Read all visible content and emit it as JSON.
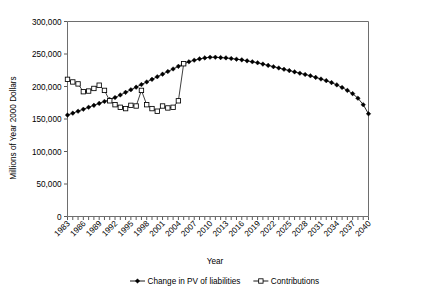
{
  "chart_data": {
    "type": "line",
    "title": "",
    "xlabel": "Year",
    "ylabel": "Millions of Year 2000 Dollars",
    "ylim": [
      0,
      300000
    ],
    "xlim": [
      1983,
      2040
    ],
    "grid": false,
    "legend_position": "bottom",
    "ytick_labels": [
      "300,000",
      "250,000",
      "200,000",
      "150,000",
      "100,000",
      "50,000",
      "0"
    ],
    "ytick_values": [
      300000,
      250000,
      200000,
      150000,
      100000,
      50000,
      0
    ],
    "xtick_labels": [
      "1983",
      "1986",
      "1989",
      "1992",
      "1995",
      "1998",
      "2001",
      "2004",
      "2007",
      "2010",
      "2013",
      "2016",
      "2019",
      "2022",
      "2025",
      "2028",
      "2031",
      "2034",
      "2037",
      "2040"
    ],
    "xtick_values": [
      1983,
      1986,
      1989,
      1992,
      1995,
      1998,
      2001,
      2004,
      2007,
      2010,
      2013,
      2016,
      2019,
      2022,
      2025,
      2028,
      2031,
      2034,
      2037,
      2040
    ],
    "series": [
      {
        "name": "Change in PV of liabilities",
        "marker": "filled-diamond",
        "x": [
          1983,
          1984,
          1985,
          1986,
          1987,
          1988,
          1989,
          1990,
          1991,
          1992,
          1993,
          1994,
          1995,
          1996,
          1997,
          1998,
          1999,
          2000,
          2001,
          2002,
          2003,
          2004,
          2005,
          2006,
          2007,
          2008,
          2009,
          2010,
          2011,
          2012,
          2013,
          2014,
          2015,
          2016,
          2017,
          2018,
          2019,
          2020,
          2021,
          2022,
          2023,
          2024,
          2025,
          2026,
          2027,
          2028,
          2029,
          2030,
          2031,
          2032,
          2033,
          2034,
          2035,
          2036,
          2037,
          2038,
          2039,
          2040
        ],
        "values": [
          156000,
          159000,
          162000,
          165000,
          168000,
          171000,
          174000,
          177000,
          180000,
          183000,
          187000,
          191000,
          195000,
          199000,
          203000,
          207000,
          211000,
          215000,
          219000,
          223000,
          227000,
          231000,
          235000,
          238000,
          240500,
          242500,
          244000,
          245000,
          245000,
          244500,
          244000,
          243000,
          242000,
          241000,
          239500,
          238000,
          236500,
          234500,
          232500,
          230500,
          228500,
          226500,
          224500,
          222500,
          220500,
          218500,
          216500,
          214000,
          211500,
          209000,
          206000,
          202500,
          198500,
          194000,
          189000,
          182000,
          172000,
          158000
        ]
      },
      {
        "name": "Contributions",
        "marker": "open-square",
        "x": [
          1983,
          1984,
          1985,
          1986,
          1987,
          1988,
          1989,
          1990,
          1991,
          1992,
          1993,
          1994,
          1995,
          1996,
          1997,
          1998,
          1999,
          2000,
          2001,
          2002,
          2003,
          2004,
          2005
        ],
        "values": [
          211000,
          207000,
          204000,
          192000,
          193000,
          197000,
          202000,
          194000,
          178000,
          172000,
          168000,
          166000,
          171000,
          170000,
          194000,
          172000,
          166000,
          162000,
          170000,
          167000,
          168000,
          178000,
          235000
        ]
      }
    ]
  },
  "legend": {
    "items": [
      {
        "label": "Change in PV of liabilities",
        "marker": "filled-diamond"
      },
      {
        "label": "Contributions",
        "marker": "open-square"
      }
    ]
  }
}
